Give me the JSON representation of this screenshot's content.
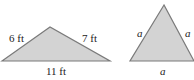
{
  "figure": {
    "triangle_left": {
      "type": "scalene",
      "sides": {
        "left": "6 ft",
        "right": "7 ft",
        "base": "11 ft"
      }
    },
    "triangle_right": {
      "type": "equilateral",
      "sides": {
        "left": "a",
        "right": "a",
        "base": "a"
      }
    },
    "colors": {
      "fill": "#d3d3d3",
      "stroke": "#7a7a7a",
      "text": "#222222"
    }
  }
}
